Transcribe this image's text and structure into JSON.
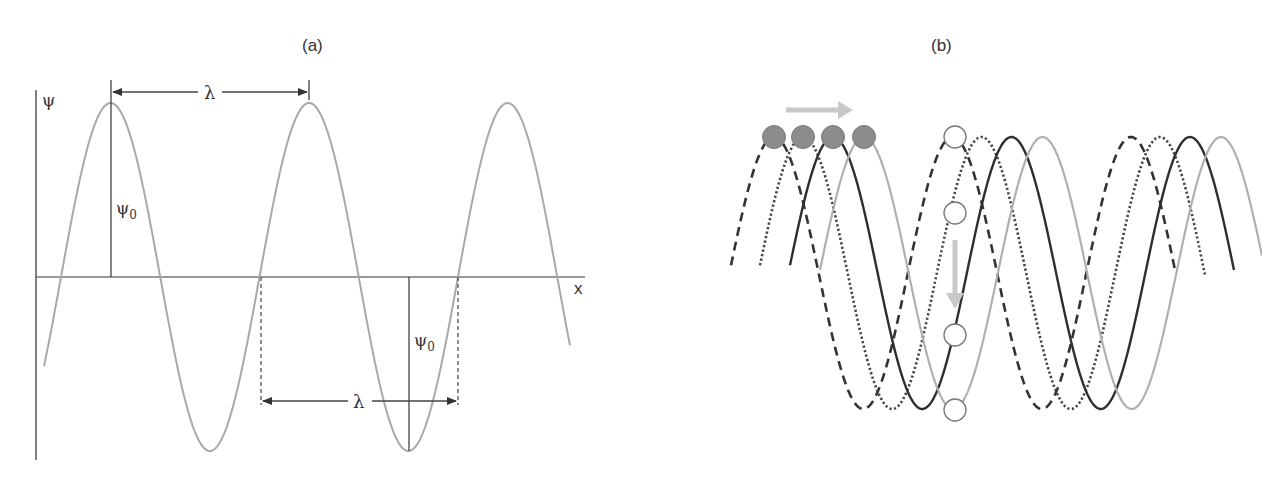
{
  "panels": {
    "a": {
      "label": "(a)",
      "y_axis_label": "ψ",
      "x_axis_label": "x",
      "amplitude_label": "ψ",
      "amplitude_subscript": "0",
      "wavelength_label": "λ",
      "wave": {
        "color": "#a9a9a9",
        "origin_x": 61,
        "axis_y": 277,
        "wavelength_px": 198.5,
        "amplitude_px": 174,
        "x_start": 44,
        "x_end": 570
      }
    },
    "b": {
      "label": "(b)",
      "wave_center_y": 273,
      "amplitude_px": 136,
      "wavelength_px": 178.5,
      "waves": [
        {
          "name": "dashed-wave",
          "style": "dashed",
          "color": "#333333",
          "peak_x": 774,
          "x_start": 731,
          "x_end": 1175
        },
        {
          "name": "dotted-wave",
          "style": "dotted",
          "color": "#444444",
          "peak_x": 803,
          "x_start": 760,
          "x_end": 1205
        },
        {
          "name": "solid-dark-wave",
          "style": "solid",
          "color": "#2e2e2e",
          "peak_x": 833,
          "x_start": 790,
          "x_end": 1234
        },
        {
          "name": "solid-light-wave",
          "style": "solid",
          "color": "#b0b0b0",
          "peak_x": 864,
          "x_start": 820,
          "x_end": 1262
        }
      ],
      "filled_circles": [
        {
          "x": 774,
          "y": 137
        },
        {
          "x": 803,
          "y": 137
        },
        {
          "x": 833,
          "y": 137
        },
        {
          "x": 864,
          "y": 137
        }
      ],
      "open_circles": [
        {
          "x": 955,
          "y": 137
        },
        {
          "x": 955,
          "y": 213
        },
        {
          "x": 955,
          "y": 335
        },
        {
          "x": 955,
          "y": 410
        }
      ],
      "horizontal_arrow": {
        "x1": 786,
        "x2": 852,
        "y": 110,
        "color": "#c8c8c8"
      },
      "vertical_arrow": {
        "x": 955,
        "y1": 240,
        "y2": 308,
        "color": "#c8c8c8"
      }
    }
  }
}
